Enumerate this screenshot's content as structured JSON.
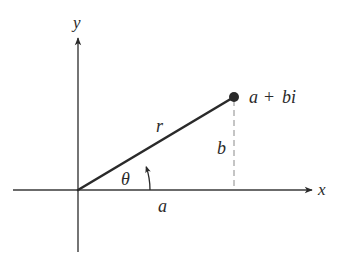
{
  "diagram": {
    "axes": {
      "x_label": "x",
      "y_label": "y"
    },
    "point": {
      "label_a": "a",
      "label_plus": "+",
      "label_bi": "bi",
      "full_label": "a + bi"
    },
    "segments": {
      "radius_label": "r",
      "horizontal_label": "a",
      "vertical_label": "b",
      "angle_label": "θ"
    },
    "colors": {
      "stroke": "#2a2a2a",
      "axis": "#3a3a3a",
      "dashed": "#8a8a8a",
      "background": "#ffffff"
    }
  }
}
